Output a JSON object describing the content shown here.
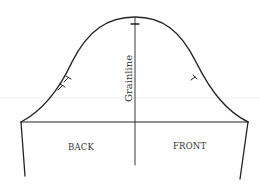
{
  "diagram": {
    "labels": {
      "grainline": "Grainline",
      "back": "BACK",
      "front": "FRONT"
    },
    "notches": {
      "cap_top": "single",
      "back_armhole": "double",
      "front_armhole": "single"
    },
    "colors": {
      "line": "#222222",
      "text": "#333333",
      "background": "#ffffff"
    }
  }
}
